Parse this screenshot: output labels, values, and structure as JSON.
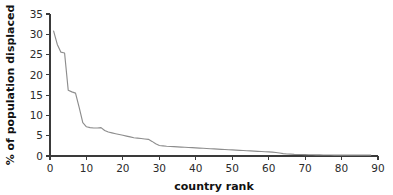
{
  "chart_data": {
    "type": "line",
    "title": "",
    "xlabel": "country rank",
    "ylabel": "% of population displaced",
    "xlim": [
      0,
      90
    ],
    "ylim": [
      0,
      35
    ],
    "xticks": [
      0,
      10,
      20,
      30,
      40,
      50,
      60,
      70,
      80,
      90
    ],
    "yticks": [
      0,
      5,
      10,
      15,
      20,
      25,
      30,
      35
    ],
    "xtick_labels": [
      "0",
      "10",
      "20",
      "30",
      "40",
      "50",
      "60",
      "70",
      "80",
      "90"
    ],
    "ytick_labels": [
      "0",
      "5",
      "10",
      "15",
      "20",
      "25",
      "30",
      "35"
    ],
    "grid": false,
    "legend": false,
    "legend_position": "none",
    "line_color": "#8d8d8d",
    "axis_color": "#3a3a3a",
    "background_color": "#ffffff",
    "series": [
      {
        "name": "% of population displaced",
        "x": [
          1,
          2,
          3,
          4,
          5,
          6,
          7,
          8,
          9,
          10,
          11,
          12,
          13,
          14,
          15,
          16,
          17,
          18,
          19,
          20,
          21,
          22,
          23,
          24,
          25,
          26,
          27,
          28,
          29,
          30,
          31,
          32,
          33,
          34,
          35,
          36,
          37,
          38,
          39,
          40,
          41,
          42,
          43,
          44,
          45,
          46,
          47,
          48,
          49,
          50,
          51,
          52,
          53,
          54,
          55,
          56,
          57,
          58,
          59,
          60,
          61,
          62,
          63,
          64,
          65,
          66,
          67,
          68,
          69,
          70,
          71,
          72,
          73,
          74,
          75,
          76,
          77,
          78,
          79,
          80,
          81,
          82,
          83,
          84,
          85,
          86,
          87,
          88
        ],
        "values": [
          30.8,
          27.5,
          25.6,
          25.4,
          16.2,
          15.8,
          15.5,
          12.0,
          8.2,
          7.2,
          7.0,
          6.9,
          6.9,
          7.0,
          6.3,
          5.9,
          5.7,
          5.5,
          5.3,
          5.1,
          4.9,
          4.7,
          4.5,
          4.4,
          4.3,
          4.2,
          4.1,
          3.6,
          3.0,
          2.6,
          2.5,
          2.4,
          2.35,
          2.3,
          2.25,
          2.2,
          2.15,
          2.1,
          2.05,
          2.0,
          1.95,
          1.9,
          1.85,
          1.8,
          1.75,
          1.7,
          1.65,
          1.6,
          1.55,
          1.5,
          1.45,
          1.4,
          1.35,
          1.3,
          1.25,
          1.2,
          1.15,
          1.1,
          1.05,
          1.0,
          0.95,
          0.85,
          0.75,
          0.6,
          0.5,
          0.45,
          0.4,
          0.38,
          0.36,
          0.34,
          0.32,
          0.3,
          0.28,
          0.27,
          0.26,
          0.25,
          0.24,
          0.22,
          0.2,
          0.2,
          0.2,
          0.2,
          0.2,
          0.2,
          0.2,
          0.2,
          0.2,
          0.2
        ]
      }
    ]
  }
}
